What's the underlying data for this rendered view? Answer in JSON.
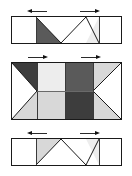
{
  "figure": {
    "background": "#ffffff",
    "stroke": "#1a1a1a",
    "width": 132,
    "height": 176
  },
  "palette": {
    "white": "#ffffff",
    "very_light_gray": "#ededed",
    "light_gray": "#d8d8d8",
    "mid_gray": "#9a9a9a",
    "dark_gray": "#5a5a5a",
    "very_dark_gray": "#3d3d3d",
    "outline": "#1a1a1a",
    "inner_divider": "#6a6a6a"
  },
  "panels": [
    {
      "name": "top-panel",
      "label": "Panel 1",
      "x": 11,
      "y": 16,
      "width": 111,
      "height": 28,
      "columns": 4,
      "markers": [
        {
          "name": "marker-left",
          "direction": "left",
          "x": 27,
          "y": 9,
          "length": 20
        },
        {
          "name": "marker-right",
          "direction": "right",
          "x": 80,
          "y": 9,
          "length": 20
        }
      ],
      "cells": [
        {
          "name": "cell-1",
          "fill": "white",
          "pattern": "solid"
        },
        {
          "name": "cell-2",
          "fill": "dark_gray",
          "pattern": "triangle-lower-left"
        },
        {
          "name": "cell-3",
          "fill": "white",
          "pattern": "triangle-upper-left"
        },
        {
          "name": "cell-4",
          "fill": "very_light_gray",
          "pattern": "triangle-lower-right"
        },
        {
          "name": "cell-5",
          "fill": "white",
          "pattern": "solid"
        }
      ]
    },
    {
      "name": "middle-panel",
      "label": "Panel 2",
      "x": 11,
      "y": 62,
      "width": 111,
      "height": 58,
      "columns": 4,
      "rows": 2,
      "markers": [
        {
          "name": "marker-left",
          "direction": "right",
          "x": 28,
          "y": 55,
          "length": 20
        },
        {
          "name": "marker-right",
          "direction": "right",
          "x": 81,
          "y": 55,
          "length": 20
        }
      ],
      "cells": [
        {
          "name": "cell-tl-outer",
          "fill": "very_dark_gray",
          "pattern": "triangle-upper-right"
        },
        {
          "name": "cell-bl-outer",
          "fill": "light_gray",
          "pattern": "triangle-lower-right"
        },
        {
          "name": "cell-top-2",
          "fill": "very_light_gray",
          "pattern": "solid"
        },
        {
          "name": "cell-bot-2",
          "fill": "light_gray",
          "pattern": "solid"
        },
        {
          "name": "cell-top-3",
          "fill": "dark_gray",
          "pattern": "solid"
        },
        {
          "name": "cell-bot-3",
          "fill": "very_dark_gray",
          "pattern": "solid"
        },
        {
          "name": "cell-tr-outer",
          "fill": "light_gray",
          "pattern": "triangle-upper-left"
        },
        {
          "name": "cell-br-outer",
          "fill": "light_gray",
          "pattern": "triangle-lower-left"
        }
      ]
    },
    {
      "name": "bottom-panel",
      "label": "Panel 3",
      "x": 11,
      "y": 138,
      "width": 111,
      "height": 28,
      "columns": 4,
      "markers": [
        {
          "name": "marker-left",
          "direction": "left",
          "x": 27,
          "y": 131,
          "length": 20
        },
        {
          "name": "marker-right",
          "direction": "right",
          "x": 80,
          "y": 131,
          "length": 20
        }
      ],
      "cells": [
        {
          "name": "cell-1",
          "fill": "white",
          "pattern": "solid"
        },
        {
          "name": "cell-2",
          "fill": "light_gray",
          "pattern": "triangle-upper-left"
        },
        {
          "name": "cell-3",
          "fill": "white",
          "pattern": "triangle-lower-left"
        },
        {
          "name": "cell-4",
          "fill": "very_light_gray",
          "pattern": "triangle-upper-right"
        },
        {
          "name": "cell-5",
          "fill": "white",
          "pattern": "solid"
        }
      ]
    }
  ]
}
